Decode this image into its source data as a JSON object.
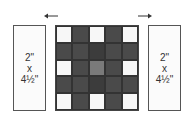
{
  "diagram": {
    "type": "quilt-block-assembly",
    "left_strip": {
      "width": "2\"",
      "times": "x",
      "height": "4½\""
    },
    "right_strip": {
      "width": "2\"",
      "times": "x",
      "height": "4½\""
    },
    "arrows": [
      {
        "position": "left",
        "direction": "left"
      },
      {
        "position": "right",
        "direction": "right"
      }
    ],
    "center_block": {
      "rows": 5,
      "cols": 5,
      "cells": [
        [
          "light",
          "dark",
          "light",
          "dark",
          "light"
        ],
        [
          "dark",
          "dark",
          "darker",
          "dark",
          "dark"
        ],
        [
          "light",
          "dark",
          "medium",
          "dark",
          "light"
        ],
        [
          "dark",
          "dark",
          "darker",
          "dark",
          "dark"
        ],
        [
          "light",
          "dark",
          "light",
          "dark",
          "light"
        ]
      ]
    },
    "colors": {
      "light": "#f7f7f7",
      "dark": "#4a4a4a",
      "darker": "#3c3c3c",
      "medium": "#7a7a7a",
      "outline": "#444444"
    }
  }
}
